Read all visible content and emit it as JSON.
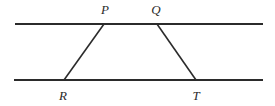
{
  "figure": {
    "kind": "geometry-diagram",
    "background_color": "#ffffff",
    "stroke_color": "#2b2b2b",
    "stroke_width": 2,
    "canvas": {
      "width": 275,
      "height": 106
    },
    "parallel_lines": [
      {
        "name": "top-parallel-line",
        "x1": 15,
        "y1": 24,
        "x2": 263,
        "y2": 24
      },
      {
        "name": "bottom-parallel-line",
        "x1": 14,
        "y1": 80,
        "x2": 263,
        "y2": 80
      }
    ],
    "transversals": [
      {
        "name": "segment-RP",
        "from": "R",
        "to": "P",
        "x1": 64,
        "y1": 80,
        "x2": 104,
        "y2": 24
      },
      {
        "name": "segment-QT",
        "from": "Q",
        "to": "T",
        "x1": 157,
        "y1": 24,
        "x2": 196,
        "y2": 80
      }
    ],
    "points": [
      {
        "id": "P",
        "label": "P",
        "x": 104,
        "y": 24,
        "label_x": 105,
        "label_y": 14
      },
      {
        "id": "Q",
        "label": "Q",
        "x": 157,
        "y": 24,
        "label_x": 156,
        "label_y": 14
      },
      {
        "id": "R",
        "label": "R",
        "x": 64,
        "y": 80,
        "label_x": 63,
        "label_y": 100
      },
      {
        "id": "T",
        "label": "T",
        "x": 196,
        "y": 80,
        "label_x": 196,
        "label_y": 100
      }
    ]
  }
}
